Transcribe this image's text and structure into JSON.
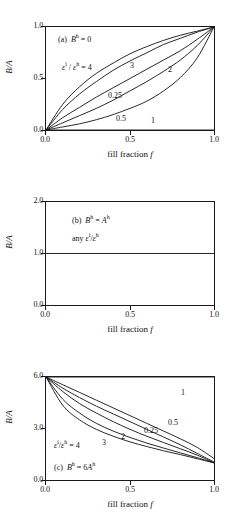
{
  "figure": {
    "xlabel_text": "fill fraction",
    "xlabel_symbol": "f",
    "ylabel": "B/A"
  },
  "chart_data": [
    {
      "type": "line",
      "panel": "a",
      "title": "(a)  Bʰ = 0",
      "panel_tag": "(a)",
      "condition": "Bʰ = 0",
      "xlabel": "fill fraction f",
      "ylabel": "B/A",
      "xlim": [
        0.0,
        1.0
      ],
      "ylim": [
        0.0,
        1.0
      ],
      "xticks": [
        "0.0",
        "0.5",
        "1.0"
      ],
      "yticks": [
        "0.0",
        "0.5",
        "1.0"
      ],
      "grid": false,
      "legend_position": "inline-curve-labels",
      "ratio_label": "εⁱ / εʰ = 4",
      "series": [
        {
          "name": "4",
          "label": "4",
          "x": [
            0.0,
            0.1,
            0.2,
            0.3,
            0.4,
            0.5,
            0.6,
            0.7,
            0.8,
            0.9,
            1.0
          ],
          "values": [
            0.0,
            0.25,
            0.42,
            0.55,
            0.65,
            0.74,
            0.81,
            0.87,
            0.92,
            0.96,
            1.0
          ]
        },
        {
          "name": "3",
          "label": "3",
          "x": [
            0.0,
            0.1,
            0.2,
            0.3,
            0.4,
            0.5,
            0.6,
            0.7,
            0.8,
            0.9,
            1.0
          ],
          "values": [
            0.0,
            0.2,
            0.35,
            0.47,
            0.58,
            0.67,
            0.75,
            0.83,
            0.89,
            0.95,
            1.0
          ]
        },
        {
          "name": "2",
          "label": "2",
          "x": [
            0.0,
            0.1,
            0.2,
            0.3,
            0.4,
            0.5,
            0.6,
            0.7,
            0.8,
            0.9,
            1.0
          ],
          "values": [
            0.0,
            0.12,
            0.22,
            0.32,
            0.41,
            0.5,
            0.59,
            0.68,
            0.77,
            0.88,
            1.0
          ]
        },
        {
          "name": "1",
          "label": "1",
          "x": [
            0.0,
            0.5,
            1.0
          ],
          "values": [
            0.0,
            0.0,
            0.0
          ]
        },
        {
          "name": "0.5",
          "label": "0.5",
          "x": [
            0.0,
            0.1,
            0.2,
            0.3,
            0.4,
            0.5,
            0.6,
            0.7,
            0.8,
            0.9,
            1.0
          ],
          "values": [
            0.0,
            0.03,
            0.06,
            0.1,
            0.15,
            0.21,
            0.28,
            0.38,
            0.51,
            0.7,
            1.0
          ]
        },
        {
          "name": "0.25",
          "label": "0.25",
          "x": [
            0.0,
            0.1,
            0.2,
            0.3,
            0.4,
            0.5,
            0.6,
            0.7,
            0.8,
            0.9,
            1.0
          ],
          "values": [
            0.0,
            0.07,
            0.14,
            0.21,
            0.29,
            0.38,
            0.47,
            0.57,
            0.68,
            0.82,
            1.0
          ]
        }
      ]
    },
    {
      "type": "line",
      "panel": "b",
      "title": "(b)  Bʰ = Aʰ",
      "panel_tag": "(b)",
      "condition": "Bʰ = Aʰ",
      "note": "any εⁱ/εʰ",
      "xlabel": "fill fraction f",
      "ylabel": "B/A",
      "xlim": [
        0.0,
        1.0
      ],
      "ylim": [
        0.0,
        2.0
      ],
      "xticks": [
        "0.0",
        "0.5",
        "1.0"
      ],
      "yticks": [
        "0.0",
        "1.0",
        "2.0"
      ],
      "grid": false,
      "series": [
        {
          "name": "all",
          "label": "",
          "x": [
            0.0,
            0.5,
            1.0
          ],
          "values": [
            1.0,
            1.0,
            1.0
          ]
        }
      ]
    },
    {
      "type": "line",
      "panel": "c",
      "title": "(c)  Bʰ = 6Aʰ",
      "panel_tag": "(c)",
      "condition": "Bʰ = 6Aʰ",
      "xlabel": "fill fraction f",
      "ylabel": "B/A",
      "xlim": [
        0.0,
        1.0
      ],
      "ylim": [
        0.0,
        6.0
      ],
      "xticks": [
        "0.0",
        "0.5",
        "1.0"
      ],
      "yticks": [
        "0.0",
        "3.0",
        "6.0"
      ],
      "grid": false,
      "legend_position": "inline-curve-labels",
      "ratio_label": "εⁱ/εʰ = 4",
      "series": [
        {
          "name": "1",
          "label": "1",
          "x": [
            0.0,
            0.5,
            1.0
          ],
          "values": [
            6.0,
            6.0,
            6.0
          ]
        },
        {
          "name": "0.5",
          "label": "0.5",
          "x": [
            0.0,
            0.1,
            0.2,
            0.3,
            0.4,
            0.5,
            0.6,
            0.7,
            0.8,
            0.9,
            1.0
          ],
          "values": [
            6.0,
            5.55,
            5.1,
            4.65,
            4.2,
            3.75,
            3.3,
            2.85,
            2.4,
            1.9,
            1.25
          ]
        },
        {
          "name": "0.25",
          "label": "0.25",
          "x": [
            0.0,
            0.1,
            0.2,
            0.3,
            0.4,
            0.5,
            0.6,
            0.7,
            0.8,
            0.9,
            1.0
          ],
          "values": [
            6.0,
            5.35,
            4.8,
            4.3,
            3.85,
            3.4,
            2.95,
            2.5,
            2.05,
            1.55,
            1.05
          ]
        },
        {
          "name": "2",
          "label": "2",
          "x": [
            0.0,
            0.1,
            0.2,
            0.3,
            0.4,
            0.5,
            0.6,
            0.7,
            0.8,
            0.9,
            1.0
          ],
          "values": [
            6.0,
            5.15,
            4.45,
            3.9,
            3.4,
            2.95,
            2.55,
            2.18,
            1.82,
            1.45,
            1.0
          ]
        },
        {
          "name": "3",
          "label": "3",
          "x": [
            0.0,
            0.1,
            0.2,
            0.3,
            0.4,
            0.5,
            0.6,
            0.7,
            0.8,
            0.9,
            1.0
          ],
          "values": [
            6.0,
            4.7,
            3.9,
            3.3,
            2.85,
            2.48,
            2.15,
            1.86,
            1.58,
            1.3,
            1.0
          ]
        },
        {
          "name": "4",
          "label": "4",
          "x": [
            0.0,
            0.1,
            0.2,
            0.3,
            0.4,
            0.5,
            0.6,
            0.7,
            0.8,
            0.9,
            1.0
          ],
          "values": [
            6.0,
            4.35,
            3.5,
            2.95,
            2.55,
            2.22,
            1.95,
            1.7,
            1.48,
            1.24,
            1.0
          ]
        }
      ]
    }
  ]
}
